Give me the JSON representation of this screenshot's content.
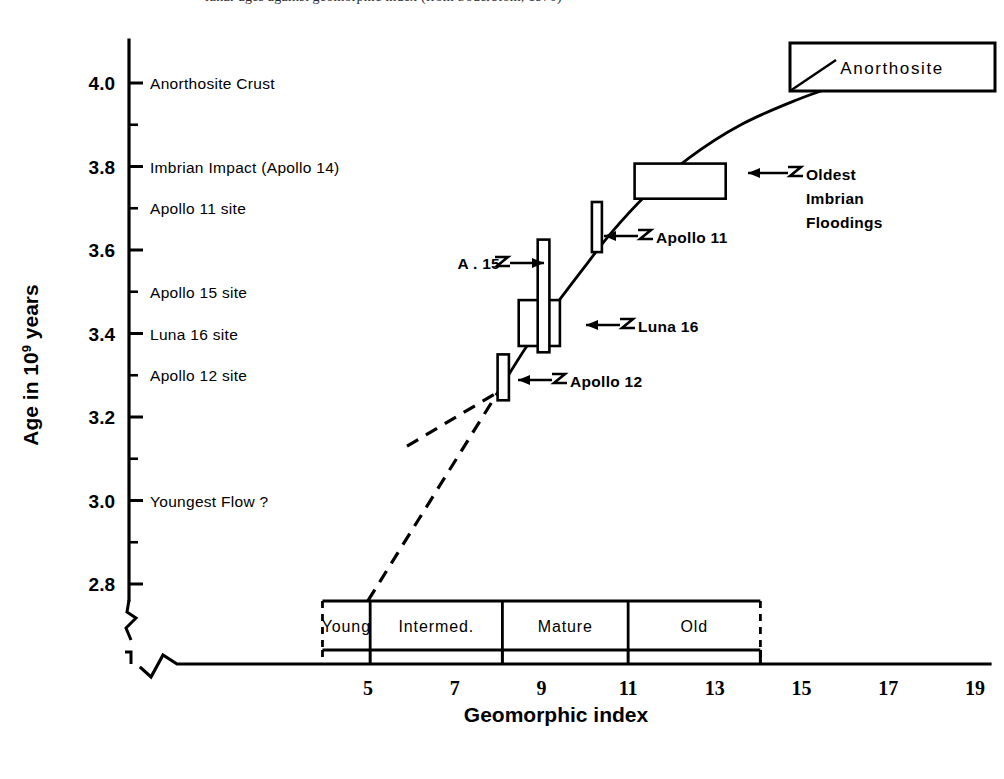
{
  "caption": {
    "text": "lunar ages against geomorphic index  (from Soderblom, 1970)"
  },
  "chart_data": {
    "type": "line",
    "title": "",
    "xlabel": "Geomorphic index",
    "ylabel": "Age in 10",
    "ylabel_exponent": "9",
    "ylabel_suffix": " years",
    "xlim": [
      3.0,
      19.8
    ],
    "ylim": [
      2.72,
      4.08
    ],
    "grid": false,
    "legend": "none",
    "x_ticks": [
      5,
      7,
      9,
      11,
      13,
      15,
      17,
      19
    ],
    "x_tick_labels": [
      "5",
      "7",
      "9",
      "11",
      "13",
      "15",
      "17",
      "19"
    ],
    "y_ticks_major": [
      2.8,
      3.0,
      3.2,
      3.4,
      3.6,
      3.8,
      4.0
    ],
    "y_tick_labels": [
      "2.8",
      "3.0",
      "3.2",
      "3.4",
      "3.6",
      "3.8",
      "4.0"
    ],
    "y_ticks_minor": [
      2.9,
      3.1,
      3.3,
      3.5,
      3.7,
      3.9
    ],
    "axis_break_x": true,
    "axis_break_y": true,
    "curve_label": "Age vs geomorphic index calibration curve",
    "curve_points": [
      {
        "x": 8.0,
        "y": 3.26
      },
      {
        "x": 8.6,
        "y": 3.36
      },
      {
        "x": 9.2,
        "y": 3.45
      },
      {
        "x": 10.0,
        "y": 3.56
      },
      {
        "x": 10.6,
        "y": 3.64
      },
      {
        "x": 11.4,
        "y": 3.73
      },
      {
        "x": 12.4,
        "y": 3.82
      },
      {
        "x": 13.6,
        "y": 3.9
      },
      {
        "x": 14.9,
        "y": 3.96
      },
      {
        "x": 16.0,
        "y": 4.0
      }
    ],
    "dashed_branches": [
      {
        "name": "upper-dashed-branch",
        "points": [
          {
            "x": 5.9,
            "y": 3.13
          },
          {
            "x": 8.0,
            "y": 3.26
          }
        ]
      },
      {
        "name": "lower-dashed-branch",
        "points": [
          {
            "x": 5.0,
            "y": 2.76
          },
          {
            "x": 8.0,
            "y": 3.26
          }
        ]
      }
    ],
    "data_boxes": [
      {
        "name": "apollo-12",
        "label": "Apollo 12",
        "x_center": 8.12,
        "x_width": 0.26,
        "y_center": 3.295,
        "y_error": 0.055
      },
      {
        "name": "luna-16",
        "label": "Luna 16",
        "x_center": 8.95,
        "x_width": 0.95,
        "y_center": 3.425,
        "y_error": 0.055
      },
      {
        "name": "apollo-15",
        "label": "A . 15",
        "x_center": 9.05,
        "x_width": 0.27,
        "y_center": 3.49,
        "y_error": 0.135
      },
      {
        "name": "apollo-11",
        "label": "Apollo 11",
        "x_center": 10.28,
        "x_width": 0.23,
        "y_center": 3.655,
        "y_error": 0.06
      },
      {
        "name": "oldest-imbrian-floodings",
        "label": "Oldest Imbrian Floodings",
        "x_center": 12.2,
        "x_width": 2.1,
        "y_center": 3.765,
        "y_error": 0.042
      }
    ]
  },
  "y_axis_events": [
    {
      "label": "Anorthosite Crust",
      "y": 4.0
    },
    {
      "label": "Imbrian Impact (Apollo 14)",
      "y": 3.8
    },
    {
      "label": "Apollo 11 site",
      "y": 3.7
    },
    {
      "label": "Apollo 15 site",
      "y": 3.5
    },
    {
      "label": "Luna 16 site",
      "y": 3.4
    },
    {
      "label": "Apollo 12 site",
      "y": 3.3
    },
    {
      "label": "Youngest Flow ?",
      "y": 3.0
    }
  ],
  "annotations": [
    {
      "name": "anorthosite-callout",
      "text": "Anorthosite",
      "kind": "box"
    },
    {
      "name": "oldest-imbrian-callout",
      "lines": [
        "Oldest",
        "Imbrian",
        "Floodings"
      ],
      "kind": "arrow"
    },
    {
      "name": "apollo-11-callout",
      "text": "Apollo 11",
      "kind": "arrow"
    },
    {
      "name": "luna-16-callout",
      "text": "Luna 16",
      "kind": "arrow"
    },
    {
      "name": "apollo-12-callout",
      "text": "Apollo 12",
      "kind": "arrow"
    },
    {
      "name": "apollo-15-callout",
      "text": "A . 15",
      "kind": "arrow-left"
    }
  ],
  "geomorphic_categories": {
    "bar_start_index": 3.95,
    "bar_end_index": 14.05,
    "items": [
      {
        "label": "Young",
        "from": 3.95,
        "to": 5.05
      },
      {
        "label": "Intermed.",
        "from": 5.05,
        "to": 8.1
      },
      {
        "label": "Mature",
        "from": 8.1,
        "to": 11.0
      },
      {
        "label": "Old",
        "from": 11.0,
        "to": 14.05
      }
    ]
  }
}
